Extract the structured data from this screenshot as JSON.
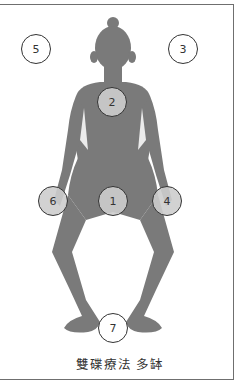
{
  "diagram": {
    "caption": "雙碟療法 多缽",
    "colors": {
      "body": "#7a7a7a",
      "marker_fill": "#cdcdcd",
      "marker_stroke": "#333333",
      "frame": "#6f6f6f"
    },
    "markers": [
      {
        "id": "1",
        "label": "1",
        "position": "pelvis"
      },
      {
        "id": "2",
        "label": "2",
        "position": "chest"
      },
      {
        "id": "3",
        "label": "3",
        "position": "above-left-of-head"
      },
      {
        "id": "4",
        "label": "4",
        "position": "left-hand"
      },
      {
        "id": "5",
        "label": "5",
        "position": "above-right-of-head"
      },
      {
        "id": "6",
        "label": "6",
        "position": "right-hand"
      },
      {
        "id": "7",
        "label": "7",
        "position": "between-feet"
      }
    ]
  }
}
